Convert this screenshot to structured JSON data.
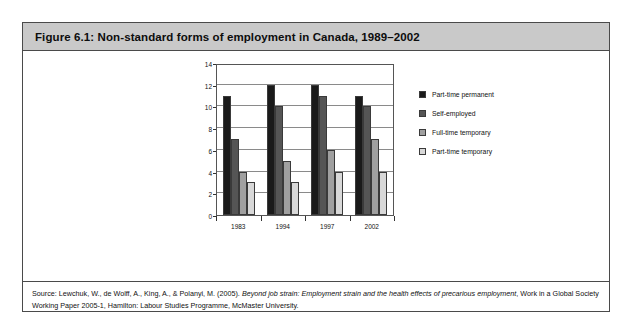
{
  "figure": {
    "title": "Figure 6.1: Non-standard forms of employment in Canada, 1989–2002",
    "source_prefix": "Source:  Lewchuk, W., de Wolff, A., King, A., & Polanyi, M. (2005). ",
    "source_italic": "Beyond job strain: Employment strain and the health effects of precarious employment",
    "source_suffix": ", Work in a Global Society Working Paper 2005-1, Hamilton: Labour Studies Programme, McMaster University."
  },
  "colors": {
    "series": [
      "#1a1a1a",
      "#555555",
      "#a0a0a0",
      "#d8d8d8"
    ],
    "frame": "#4a4a4a",
    "title_bar": "#c9c9c9",
    "gridline": "#8a8a8a"
  },
  "chart_data": {
    "type": "bar",
    "title": "Non-standard forms of employment in Canada, 1989–2002",
    "xlabel": "",
    "ylabel": "% total employment",
    "categories": [
      "1983",
      "1994",
      "1997",
      "2002"
    ],
    "yticks": [
      0,
      2,
      4,
      6,
      8,
      10,
      12,
      14
    ],
    "ylim": [
      0,
      14
    ],
    "grid": true,
    "legend_position": "right",
    "series": [
      {
        "name": "Part-time permanent",
        "values": [
          11,
          12,
          12,
          11
        ]
      },
      {
        "name": "Self-employed",
        "values": [
          7,
          10,
          11,
          10
        ]
      },
      {
        "name": "Full-time temporary",
        "values": [
          4,
          5,
          6,
          7
        ]
      },
      {
        "name": "Part-time temporary",
        "values": [
          3,
          3,
          4,
          4
        ]
      }
    ]
  }
}
